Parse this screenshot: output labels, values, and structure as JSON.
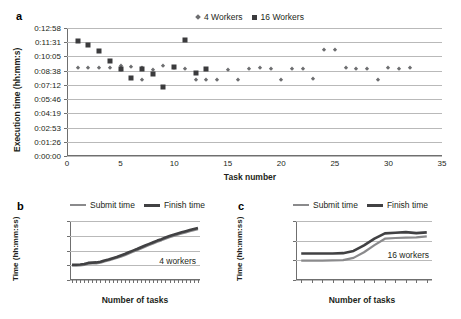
{
  "figure": {
    "panel_a_label": "a",
    "panel_b_label": "b",
    "panel_c_label": "c"
  },
  "chart_data": [
    {
      "id": "a",
      "type": "scatter",
      "title": "",
      "xlabel": "Task number",
      "ylabel": "Execution time (hh:mm:s)",
      "xlim": [
        0,
        35
      ],
      "ylim_seconds": [
        0,
        778
      ],
      "xticks": [
        "0",
        "5",
        "10",
        "15",
        "20",
        "25",
        "30",
        "35"
      ],
      "yticks": [
        "0:00:00",
        "0:01:26",
        "0:02:53",
        "0:04:19",
        "0:05:46",
        "0:07:12",
        "0:08:38",
        "0:10:05",
        "0:11:31",
        "0:12:58"
      ],
      "grid": true,
      "legend_position": "top",
      "series": [
        {
          "name": "4 Workers",
          "marker": "diamond",
          "color": "#6d6e70",
          "x": [
            1,
            2,
            3,
            4,
            5,
            5,
            6,
            7,
            7,
            8,
            9,
            10,
            11,
            12,
            13,
            14,
            15,
            16,
            17,
            18,
            19,
            20,
            21,
            22,
            23,
            24,
            25,
            26,
            27,
            28,
            29,
            30,
            31,
            32
          ],
          "y": [
            "0:08:55",
            "0:08:52",
            "0:08:55",
            "0:08:52",
            "0:09:05",
            "0:08:45",
            "0:09:00",
            "0:08:52",
            "0:07:40",
            "0:08:45",
            "0:09:05",
            "0:08:55",
            "0:08:50",
            "0:07:40",
            "0:07:40",
            "0:07:40",
            "0:08:45",
            "0:07:40",
            "0:08:48",
            "0:08:55",
            "0:08:48",
            "0:07:40",
            "0:08:50",
            "0:08:50",
            "0:07:45",
            "0:10:45",
            "0:10:45",
            "0:08:55",
            "0:08:50",
            "0:08:48",
            "0:07:40",
            "0:08:55",
            "0:08:48",
            "0:08:52"
          ]
        },
        {
          "name": "16 Workers",
          "marker": "square",
          "color": "#3b3b3d",
          "x": [
            1,
            2,
            3,
            4,
            5,
            6,
            7,
            8,
            9,
            10,
            11,
            12,
            13
          ],
          "y": [
            "0:11:42",
            "0:11:12",
            "0:10:38",
            "0:09:35",
            "0:08:50",
            "0:07:55",
            "0:08:50",
            "0:08:20",
            "0:07:00",
            "0:09:00",
            "0:11:45",
            "0:08:25",
            "0:08:50"
          ]
        }
      ]
    },
    {
      "id": "b",
      "type": "line",
      "title": "",
      "annotation": "4 workers",
      "xlabel": "Number of tasks",
      "ylabel": "Time (hh:mm:ss)",
      "xticks": [
        "1",
        "4",
        "7",
        "10",
        "13",
        "16",
        "19",
        "22",
        "25",
        "28",
        "31"
      ],
      "yticks": [
        "20:24:00",
        "21:36:00",
        "22:48:00",
        "0:00:00",
        "1:12:00"
      ],
      "grid": true,
      "legend_position": "top",
      "x": [
        1,
        2,
        3,
        4,
        5,
        6,
        7,
        8,
        9,
        10,
        11,
        12,
        13,
        14,
        15,
        16,
        17,
        18,
        19,
        20,
        21,
        22,
        23,
        24,
        25,
        26,
        27,
        28,
        29,
        30,
        31,
        32
      ],
      "series": [
        {
          "name": "Submit time",
          "color": "#8a8a8c",
          "values_frac": [
            0.245,
            0.245,
            0.248,
            0.255,
            0.275,
            0.28,
            0.282,
            0.292,
            0.315,
            0.33,
            0.352,
            0.372,
            0.395,
            0.42,
            0.45,
            0.478,
            0.505,
            0.535,
            0.565,
            0.592,
            0.62,
            0.648,
            0.672,
            0.7,
            0.725,
            0.748,
            0.768,
            0.788,
            0.808,
            0.828,
            0.845,
            0.862
          ]
        },
        {
          "name": "Finish time",
          "color": "#414143",
          "values_frac": [
            0.258,
            0.258,
            0.262,
            0.27,
            0.29,
            0.295,
            0.298,
            0.308,
            0.332,
            0.348,
            0.37,
            0.39,
            0.415,
            0.44,
            0.47,
            0.498,
            0.525,
            0.555,
            0.585,
            0.612,
            0.64,
            0.668,
            0.692,
            0.72,
            0.745,
            0.768,
            0.788,
            0.808,
            0.828,
            0.848,
            0.865,
            0.882
          ]
        }
      ]
    },
    {
      "id": "c",
      "type": "line",
      "title": "",
      "annotation": "16 workers",
      "xlabel": "Number of tasks",
      "ylabel": "Time (hh:mm:ss)",
      "xticks": [
        "1",
        "2",
        "3",
        "4",
        "5",
        "6",
        "7",
        "8",
        "9",
        "10",
        "11",
        "12",
        "13"
      ],
      "yticks": [
        "11:31:12",
        "12:00:00",
        "12:28:48",
        "12:57:36"
      ],
      "grid": true,
      "legend_position": "top",
      "x": [
        1,
        2,
        3,
        4,
        5,
        6,
        7,
        8,
        9,
        10,
        11,
        12,
        13
      ],
      "series": [
        {
          "name": "Submit time",
          "color": "#8a8a8c",
          "values_frac": [
            0.33,
            0.33,
            0.33,
            0.332,
            0.338,
            0.375,
            0.47,
            0.59,
            0.7,
            0.712,
            0.718,
            0.722,
            0.74
          ]
        },
        {
          "name": "Finish time",
          "color": "#414143",
          "values_frac": [
            0.448,
            0.448,
            0.448,
            0.45,
            0.455,
            0.492,
            0.588,
            0.702,
            0.79,
            0.8,
            0.812,
            0.795,
            0.808
          ]
        }
      ]
    }
  ]
}
